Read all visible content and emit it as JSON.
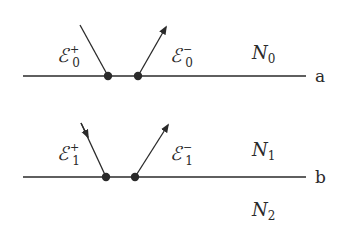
{
  "colors": {
    "stroke": "#2a2a2a",
    "background": "#ffffff"
  },
  "interfaces": [
    {
      "label": "a",
      "y": 76
    },
    {
      "label": "b",
      "y": 177
    }
  ],
  "labels": {
    "field_top_incident": {
      "symbol": "ℰ",
      "sub": "0",
      "sup": "+"
    },
    "field_top_reflected": {
      "symbol": "ℰ",
      "sub": "0",
      "sup": "−"
    },
    "field_bot_incident": {
      "symbol": "ℰ",
      "sub": "1",
      "sup": "+"
    },
    "field_bot_reflected": {
      "symbol": "ℰ",
      "sub": "1",
      "sup": "−"
    },
    "medium_0": {
      "symbol": "N",
      "sub": "0"
    },
    "medium_1": {
      "symbol": "N",
      "sub": "1"
    },
    "medium_2": {
      "symbol": "N",
      "sub": "2"
    }
  }
}
